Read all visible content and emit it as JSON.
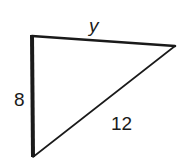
{
  "diagram": {
    "type": "right-triangle",
    "vertices": {
      "top_left": {
        "x": 32,
        "y": 36
      },
      "right": {
        "x": 175,
        "y": 46
      },
      "bottom": {
        "x": 33,
        "y": 157
      }
    },
    "sides": {
      "top": {
        "label": "y",
        "from": "top_left",
        "to": "right"
      },
      "left": {
        "label": "8",
        "from": "top_left",
        "to": "bottom"
      },
      "hypotenuse": {
        "label": "12",
        "from": "bottom",
        "to": "right"
      }
    },
    "right_angle_at": "top_left",
    "stroke_color": "#1a1a1a",
    "background": "#ffffff"
  }
}
